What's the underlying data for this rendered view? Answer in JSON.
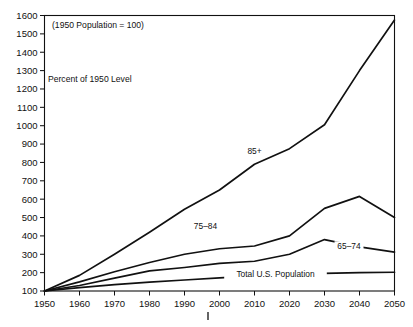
{
  "chart_data": {
    "type": "line",
    "title": "",
    "note": "(1950 Population = 100)",
    "ylabel_inline": "Percent of 1950 Level",
    "xlabel": "",
    "ylabel": "",
    "x": [
      1950,
      1960,
      1970,
      1980,
      1990,
      2000,
      2010,
      2020,
      2030,
      2040,
      2050
    ],
    "xlim": [
      1950,
      2050
    ],
    "ylim": [
      100,
      1600
    ],
    "ytick_values": [
      100,
      200,
      300,
      400,
      500,
      600,
      700,
      800,
      900,
      1000,
      1100,
      1200,
      1300,
      1400,
      1500,
      1600
    ],
    "ytick_labels": [
      "100",
      "200",
      "300",
      "400",
      "500",
      "600",
      "700",
      "800",
      "900",
      "1000",
      "1100",
      "1200",
      "1300",
      "1400",
      "1500",
      "1600"
    ],
    "xtick_labels": [
      "1950",
      "1960",
      "1970",
      "1980",
      "1990",
      "2000",
      "2010",
      "2020",
      "2030",
      "2040",
      "2050"
    ],
    "grid": false,
    "legend": "inline-labels",
    "series": [
      {
        "name": "85+",
        "label": "85+",
        "label_x": 2010,
        "label_y": 845,
        "values": [
          100,
          185,
          300,
          420,
          545,
          650,
          790,
          875,
          1005,
          1300,
          1575
        ]
      },
      {
        "name": "75-84",
        "label": "75–84",
        "label_x": 1996,
        "label_y": 440,
        "values": [
          100,
          150,
          205,
          255,
          300,
          330,
          345,
          400,
          550,
          615,
          500
        ]
      },
      {
        "name": "65-74",
        "label": "65–74",
        "label_x": 2037,
        "label_y": 330,
        "values": [
          100,
          130,
          170,
          210,
          228,
          250,
          262,
          300,
          380,
          340,
          312
        ]
      },
      {
        "name": "Total U.S. Population",
        "label": "Total U.S. Population",
        "label_x": 2016,
        "label_y": 178,
        "values": [
          100,
          118,
          135,
          148,
          160,
          172,
          182,
          190,
          196,
          200,
          202
        ]
      }
    ]
  },
  "annotations": {
    "base_note": "(1950 Population = 100)",
    "axis_note": "Percent of 1950 Level",
    "stray_tick": "|"
  },
  "colors": {
    "line": "#111111",
    "frame": "#111111",
    "background": "#ffffff",
    "text": "#111111"
  }
}
